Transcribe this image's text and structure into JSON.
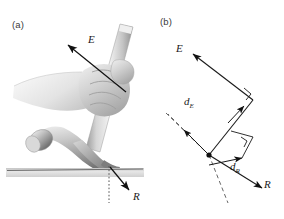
{
  "figure": {
    "caption_labels": {
      "panel_a": "(a)",
      "panel_b": "(b)"
    }
  },
  "panel_a": {
    "name": "hammer-photo-panel",
    "description": "Photograph of a hand gripping a claw hammer prying a nail from a board",
    "vectors": [
      {
        "id": "effort",
        "label": "E",
        "direction": "up-left",
        "tail": [
          126,
          92
        ],
        "head": [
          66,
          43
        ]
      },
      {
        "id": "resistance",
        "label": "R",
        "direction": "down-right",
        "tail": [
          110,
          167
        ],
        "head": [
          131,
          192
        ]
      }
    ],
    "ground_line": {
      "x1": 8,
      "y1": 172,
      "x2": 143,
      "y2": 168
    },
    "nail_dotted_line": {
      "x1": 109,
      "y1": 166,
      "x2": 109,
      "y2": 203
    }
  },
  "panel_b": {
    "name": "vector-diagram-panel",
    "description": "Free body lever diagram showing effort and resistance forces with moment arms",
    "pivot": [
      209,
      155
    ],
    "vectors": [
      {
        "id": "effort",
        "label": "E",
        "tail": [
          247,
          99
        ],
        "head": [
          191,
          53
        ]
      },
      {
        "id": "resistance",
        "label": "R",
        "tail": [
          245,
          152
        ],
        "head": [
          262,
          186
        ]
      }
    ],
    "moment_arms": [
      {
        "id": "effort-arm",
        "label_base": "d",
        "label_sub": "E",
        "tail": [
          209,
          155
        ],
        "head": [
          182,
          128
        ]
      },
      {
        "id": "resistance-arm",
        "label_base": "d",
        "label_sub": "R",
        "tail": [
          209,
          155
        ],
        "head": [
          241,
          165
        ]
      }
    ],
    "construction_lines": [
      {
        "id": "effort-line-of-action",
        "x1": 191,
        "y1": 53,
        "x2": 253,
        "y2": 105
      },
      {
        "id": "effort-arm-extension",
        "x1": 182,
        "y1": 128,
        "x2": 166,
        "y2": 113
      },
      {
        "id": "resistance-line-extension",
        "x1": 241,
        "y1": 165,
        "x2": 226,
        "y2": 200
      }
    ],
    "right_angle_markers": [
      {
        "id": "effort-right-angle",
        "x": 248,
        "y": 90
      },
      {
        "id": "resistance-right-angle",
        "x": 243,
        "y": 148
      }
    ]
  },
  "colors": {
    "stroke": "#1a1a1a",
    "dashed": "#555555",
    "label": "#3a3a3a",
    "background": "#ffffff",
    "hammer_light": "#e8e8e8",
    "hammer_mid": "#b9b9b9",
    "hammer_dark": "#8a8a8a",
    "skin_light": "#dedede",
    "skin_mid": "#bdbdbd"
  }
}
